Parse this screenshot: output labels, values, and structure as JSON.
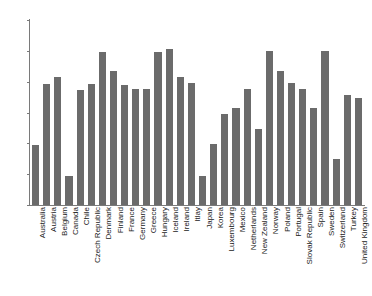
{
  "chart_data": {
    "type": "bar",
    "title": "",
    "subtitle": "",
    "xlabel": "",
    "ylabel": "",
    "ylim": [
      0,
      30
    ],
    "yticks": [
      0,
      5,
      10,
      15,
      20,
      25,
      30
    ],
    "grid": false,
    "legend": "none",
    "bar_color": "#6b6b6b",
    "axis_color": "#7a7a7a",
    "background_color": "#ffffff",
    "categories": [
      "Australia",
      "Austria",
      "Belgium",
      "Canada",
      "Chile",
      "Czech Republic",
      "Denmark",
      "Finland",
      "France",
      "Germany",
      "Greece",
      "Hungary",
      "Iceland",
      "Ireland",
      "Itlay",
      "Japan",
      "Korea",
      "Luxembourg",
      "Mexico",
      "Netherlands",
      "New Zealand",
      "Norway",
      "Poland",
      "Portugal",
      "Slovak Republic",
      "Spain",
      "Sweden",
      "Switzerland",
      "Turkey",
      "United Kingdom"
    ],
    "values": [
      9.8,
      19.7,
      20.7,
      4.7,
      18.7,
      19.7,
      24.8,
      21.8,
      19.4,
      18.8,
      18.8,
      24.8,
      25.3,
      20.8,
      19.8,
      4.7,
      9.9,
      14.8,
      15.7,
      18.8,
      12.3,
      25.0,
      21.8,
      19.8,
      18.8,
      15.7,
      25.0,
      7.4,
      17.8,
      17.3
    ]
  }
}
